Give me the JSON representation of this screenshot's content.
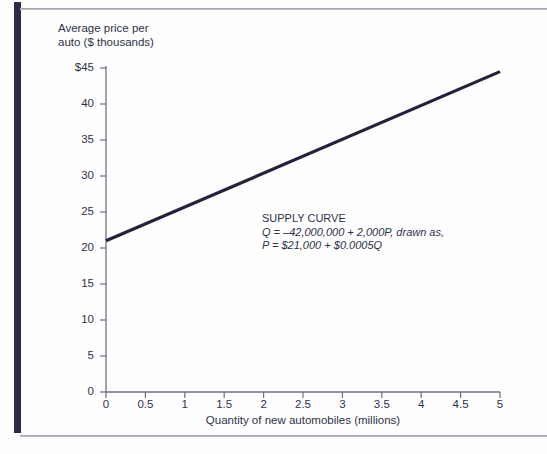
{
  "figure": {
    "y_axis_title": "Average price per\nauto ($ thousands)",
    "x_axis_title": "Quantity of new automobiles (millions)",
    "annotation": {
      "heading": "SUPPLY CURVE",
      "line1": "Q = –42,000,000 + 2,000P, drawn as,",
      "line2": "P = $21,000 + $0.0005Q"
    },
    "colors": {
      "curve": "#22223c",
      "axis": "#6b6f86",
      "text": "#2d3147",
      "left_bar": "#2c2c48",
      "rule": "#9a9aa8"
    }
  },
  "chart_data": {
    "type": "line",
    "title": "",
    "subtitle": "",
    "xlabel": "Quantity of new automobiles (millions)",
    "ylabel": "Average price per auto ($ thousands)",
    "xlim": [
      0,
      5
    ],
    "ylim": [
      0,
      45
    ],
    "xticks": [
      0,
      0.5,
      1,
      1.5,
      2,
      2.5,
      3,
      3.5,
      4,
      4.5,
      5
    ],
    "xtick_labels": [
      "0",
      "0.5",
      "1",
      "1.5",
      "2",
      "2.5",
      "3",
      "3.5",
      "4",
      "4.5",
      "5"
    ],
    "yticks": [
      0,
      5,
      10,
      15,
      20,
      25,
      30,
      35,
      40,
      45
    ],
    "ytick_labels": [
      "0",
      "5",
      "10",
      "15",
      "20",
      "25",
      "30",
      "35",
      "40",
      "$45"
    ],
    "grid": false,
    "legend": false,
    "annotations": [
      {
        "text": "SUPPLY CURVE\nQ = –42,000,000 + 2,000P, drawn as,\nP = $21,000 + $0.0005Q",
        "x": 2.0,
        "y": 23.5
      }
    ],
    "series": [
      {
        "name": "Supply curve",
        "color": "#22223c",
        "x": [
          0,
          5
        ],
        "y": [
          21,
          44.5
        ],
        "equation_q": "Q = -42,000,000 + 2,000P",
        "equation_p": "P = $21,000 + $0.0005Q",
        "intercept": 21,
        "slope_per_million": 4.7
      }
    ]
  }
}
